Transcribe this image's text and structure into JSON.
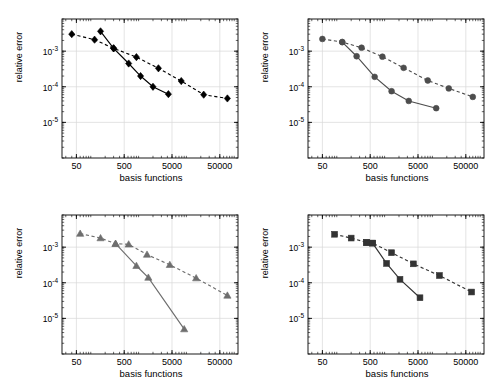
{
  "figure": {
    "width": 491,
    "height": 391,
    "background": "#ffffff",
    "layout": "2x2 grid of log-log convergence subplots"
  },
  "axis_common": {
    "xlabel": "basis functions",
    "ylabel": "relative error",
    "xticks": [
      50,
      500,
      5000,
      50000
    ],
    "xtick_labels": [
      "50",
      "500",
      "5000",
      "50000"
    ],
    "yticks": [
      0.001,
      0.0001,
      1e-05
    ],
    "ytick_labels": [
      "10-3",
      "10-4",
      "10-5"
    ],
    "ytick_mantissa": "10",
    "ytick_exponents": [
      "-3",
      "-4",
      "-5"
    ],
    "xlim": [
      25,
      120000
    ],
    "ylim": [
      1e-06,
      0.008
    ],
    "xscale": "log",
    "yscale": "log",
    "grid": true,
    "grid_color": "#d9d9d9",
    "box_color": "#000000"
  },
  "styles": {
    "dashed_label": "dashed series",
    "solid_label": "solid series",
    "black": "#000000",
    "darkgray": "#4d4d4d",
    "gray": "#6e6e6e"
  },
  "chart_data": [
    {
      "id": "panel-top-left",
      "type": "line",
      "title": "",
      "xlabel": "basis functions",
      "ylabel": "relative error",
      "xscale": "log",
      "yscale": "log",
      "xlim": [
        25,
        120000
      ],
      "ylim": [
        1e-06,
        0.008
      ],
      "xticks": [
        50,
        500,
        5000,
        50000
      ],
      "yticks": [
        0.001,
        0.0001,
        1e-05
      ],
      "grid": true,
      "marker": "diamond",
      "color": "#000000",
      "series": [
        {
          "name": "dashed",
          "linestyle": "dashed",
          "marker": "diamond",
          "color": "#000000",
          "x": [
            40,
            120,
            300,
            900,
            2600,
            7800,
            23000,
            72000
          ],
          "y": [
            0.003,
            0.0021,
            0.0012,
            0.00068,
            0.00033,
            0.000145,
            6e-05,
            4.7e-05
          ]
        },
        {
          "name": "solid",
          "linestyle": "solid",
          "marker": "diamond",
          "color": "#000000",
          "x": [
            160,
            300,
            620,
            1100,
            2000,
            4200
          ],
          "y": [
            0.0036,
            0.0012,
            0.00045,
            0.0002,
            0.0001,
            6.2e-05
          ]
        }
      ]
    },
    {
      "id": "panel-top-right",
      "type": "line",
      "title": "",
      "xlabel": "basis functions",
      "ylabel": "relative error",
      "xscale": "log",
      "yscale": "log",
      "xlim": [
        25,
        120000
      ],
      "ylim": [
        1e-06,
        0.008
      ],
      "xticks": [
        50,
        500,
        5000,
        50000
      ],
      "yticks": [
        0.001,
        0.0001,
        1e-05
      ],
      "grid": true,
      "marker": "circle",
      "color": "#4d4d4d",
      "series": [
        {
          "name": "dashed",
          "linestyle": "dashed",
          "marker": "circle",
          "color": "#4d4d4d",
          "x": [
            50,
            130,
            330,
            900,
            2500,
            8000,
            22000,
            70000
          ],
          "y": [
            0.0022,
            0.0018,
            0.00125,
            0.0007,
            0.00034,
            0.00015,
            9e-05,
            5.2e-05
          ]
        },
        {
          "name": "solid",
          "linestyle": "solid",
          "marker": "circle",
          "color": "#4d4d4d",
          "x": [
            130,
            260,
            620,
            1400,
            3200,
            12000
          ],
          "y": [
            0.0018,
            0.00072,
            0.00019,
            7.5e-05,
            4e-05,
            2.5e-05
          ]
        }
      ]
    },
    {
      "id": "panel-bottom-left",
      "type": "line",
      "title": "",
      "xlabel": "basis functions",
      "ylabel": "relative error",
      "xscale": "log",
      "yscale": "log",
      "xlim": [
        25,
        120000
      ],
      "ylim": [
        1e-06,
        0.008
      ],
      "xticks": [
        50,
        500,
        5000,
        50000
      ],
      "yticks": [
        0.001,
        0.0001,
        1e-05
      ],
      "grid": true,
      "marker": "triangle",
      "color": "#6e6e6e",
      "series": [
        {
          "name": "dashed",
          "linestyle": "dashed",
          "marker": "triangle",
          "color": "#6e6e6e",
          "x": [
            60,
            160,
            330,
            620,
            1500,
            4500,
            16000,
            72000
          ],
          "y": [
            0.0024,
            0.0018,
            0.00125,
            0.0012,
            0.00062,
            0.00032,
            0.000135,
            4.4e-05
          ]
        },
        {
          "name": "solid",
          "linestyle": "solid",
          "marker": "triangle",
          "color": "#6e6e6e",
          "x": [
            330,
            900,
            1600,
            9000
          ],
          "y": [
            0.00125,
            0.0003,
            0.00014,
            5e-06
          ]
        }
      ]
    },
    {
      "id": "panel-bottom-right",
      "type": "line",
      "title": "",
      "xlabel": "basis functions",
      "ylabel": "relative error",
      "xscale": "log",
      "yscale": "log",
      "xlim": [
        25,
        120000
      ],
      "ylim": [
        1e-06,
        0.008
      ],
      "xticks": [
        50,
        500,
        5000,
        50000
      ],
      "yticks": [
        0.001,
        0.0001,
        1e-05
      ],
      "grid": true,
      "marker": "square",
      "color": "#333333",
      "series": [
        {
          "name": "dashed",
          "linestyle": "dashed",
          "marker": "square",
          "color": "#333333",
          "x": [
            90,
            200,
            420,
            560,
            1400,
            4000,
            14000,
            66000
          ],
          "y": [
            0.0023,
            0.0018,
            0.00135,
            0.0013,
            0.0007,
            0.00034,
            0.00016,
            5.5e-05
          ]
        },
        {
          "name": "solid",
          "linestyle": "solid",
          "marker": "square",
          "color": "#333333",
          "x": [
            420,
            560,
            1100,
            2100,
            5500
          ],
          "y": [
            0.00135,
            0.0013,
            0.00035,
            0.000125,
            3.8e-05
          ]
        }
      ]
    }
  ]
}
